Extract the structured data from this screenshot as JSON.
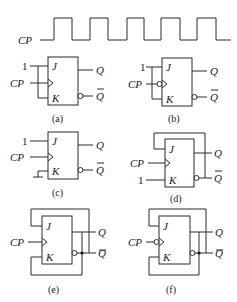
{
  "waveform": {
    "label": "CP",
    "low_y": 40,
    "high_y": 18,
    "points": "40,40 54,40 54,18 72,18 72,40 90,40 90,18 108,18 108,40 127,40 127,18 144,18 144,40 161,40 161,18 180,18 180,40 197,40 197,18 216,18 216,40 231,40"
  },
  "pins": {
    "j": "J",
    "k": "K",
    "q": "Q",
    "qbar": "Q",
    "cp": "CP",
    "one": "1"
  },
  "circuits": [
    {
      "id": "a",
      "caption": "(a)",
      "description": "J and K tied to 1, rising-edge clock"
    },
    {
      "id": "b",
      "caption": "(b)",
      "description": "J and K tied to 1, falling-edge clock"
    },
    {
      "id": "c",
      "caption": "(c)",
      "description": "J=1, K grounded, rising-edge clock"
    },
    {
      "id": "d",
      "caption": "(d)",
      "description": "J fed from Q-bar, K=1, rising-edge clock"
    },
    {
      "id": "e",
      "caption": "(e)",
      "description": "J fed from Q-bar, K fed from Q, rising-edge clock"
    },
    {
      "id": "f",
      "caption": "(f)",
      "description": "J fed from Q-bar, K fed from Q, falling-edge clock"
    }
  ]
}
